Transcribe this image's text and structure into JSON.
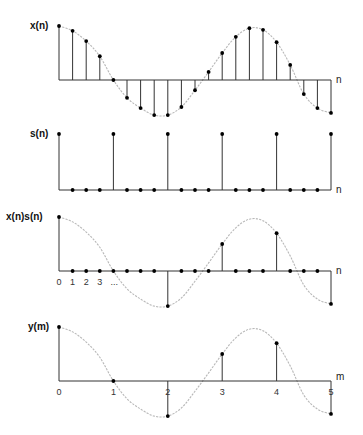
{
  "figure": {
    "colors": {
      "stem": "#333333",
      "dot": "#000000",
      "envelope": "#b8b8b8",
      "axis": "#333333",
      "background": "#ffffff"
    }
  },
  "panels": [
    {
      "id": "x",
      "label": "x(n)",
      "axis_label": "n",
      "baseline_y": 80,
      "scale": 54,
      "show_envelope": true
    },
    {
      "id": "s",
      "label": "s(n)",
      "axis_label": "n",
      "baseline_y": 190,
      "scale": 56,
      "show_envelope": false
    },
    {
      "id": "xs",
      "label": "x(n)s(n)",
      "axis_label": "n",
      "baseline_y": 271,
      "scale": 54,
      "show_envelope": true,
      "tick_labels": [
        "0",
        "1",
        "2",
        "3",
        "..."
      ]
    },
    {
      "id": "y",
      "label": "y(m)",
      "axis_label": "m",
      "baseline_y": 381,
      "scale": 54,
      "show_envelope": true,
      "tick_labels": [
        "0",
        "1",
        "2",
        "3",
        "4",
        "5"
      ]
    }
  ],
  "chart_data": [
    {
      "type": "stem",
      "title": "x(n)",
      "xlabel": "n",
      "x": [
        0,
        1,
        2,
        3,
        4,
        5,
        6,
        7,
        8,
        9,
        10,
        11,
        12,
        13,
        14,
        15,
        16,
        17,
        18,
        19,
        20
      ],
      "values": [
        1.0,
        0.91,
        0.72,
        0.44,
        0.0,
        -0.33,
        -0.52,
        -0.65,
        -0.65,
        -0.5,
        -0.19,
        0.15,
        0.5,
        0.8,
        0.96,
        0.93,
        0.7,
        0.28,
        -0.26,
        -0.52,
        -0.61
      ],
      "envelope": true
    },
    {
      "type": "stem",
      "title": "s(n)",
      "xlabel": "n",
      "x": [
        0,
        1,
        2,
        3,
        4,
        5,
        6,
        7,
        8,
        9,
        10,
        11,
        12,
        13,
        14,
        15,
        16,
        17,
        18,
        19,
        20
      ],
      "values": [
        1,
        0,
        0,
        0,
        1,
        0,
        0,
        0,
        1,
        0,
        0,
        0,
        1,
        0,
        0,
        0,
        1,
        0,
        0,
        0,
        1
      ],
      "period": 4
    },
    {
      "type": "stem",
      "title": "x(n)s(n)",
      "xlabel": "n",
      "x": [
        0,
        1,
        2,
        3,
        4,
        5,
        6,
        7,
        8,
        9,
        10,
        11,
        12,
        13,
        14,
        15,
        16,
        17,
        18,
        19,
        20
      ],
      "values": [
        1.0,
        0,
        0,
        0,
        0.0,
        0,
        0,
        0,
        -0.65,
        0,
        0,
        0,
        0.5,
        0,
        0,
        0,
        0.7,
        0,
        0,
        0,
        -0.61
      ],
      "tick_labels": [
        "0",
        "1",
        "2",
        "3",
        "..."
      ],
      "envelope": true
    },
    {
      "type": "stem",
      "title": "y(m)",
      "xlabel": "m",
      "x": [
        0,
        1,
        2,
        3,
        4,
        5
      ],
      "values": [
        1.0,
        0.0,
        -0.65,
        0.5,
        0.7,
        -0.61
      ],
      "tick_labels": [
        "0",
        "1",
        "2",
        "3",
        "4",
        "5"
      ],
      "envelope": true
    }
  ]
}
